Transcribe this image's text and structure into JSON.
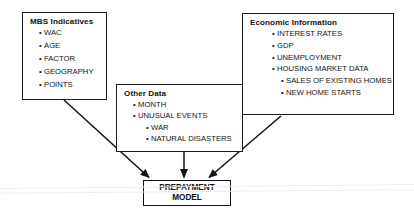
{
  "diagram": {
    "colors": {
      "border": "#1c1c1c",
      "text": "#141414",
      "background": "#ffffff",
      "arrow": "#111111"
    },
    "boxes": [
      {
        "id": "mbs-indicatives",
        "header": "MBS Indicatives",
        "items": [
          {
            "label": "WAC",
            "level": 1,
            "bullet": "•"
          },
          {
            "label": "AGE",
            "level": 1,
            "bullet": "•"
          },
          {
            "label": "FACTOR",
            "level": 1,
            "bullet": "•"
          },
          {
            "label": "GEOGRAPHY",
            "level": 1,
            "bullet": "•"
          },
          {
            "label": "POINTS",
            "level": 1,
            "bullet": "•"
          }
        ]
      },
      {
        "id": "other-data",
        "header": "Other Data",
        "items": [
          {
            "label": "MONTH",
            "level": 1,
            "bullet": "•"
          },
          {
            "label": "UNUSUAL EVENTS",
            "level": 1,
            "bullet": "•"
          },
          {
            "label": "WAR",
            "level": 2,
            "bullet": "•"
          },
          {
            "label": "NATURAL DISASTERS",
            "level": 2,
            "bullet": "•"
          }
        ]
      },
      {
        "id": "economic-information",
        "header": "Economic Information",
        "items": [
          {
            "label": "INTEREST RATES",
            "level": 1,
            "bullet": "•"
          },
          {
            "label": "GDP",
            "level": 1,
            "bullet": "•"
          },
          {
            "label": "UNEMPLOYMENT",
            "level": 1,
            "bullet": "•"
          },
          {
            "label": "HOUSING MARKET DATA",
            "level": 1,
            "bullet": "•"
          },
          {
            "label": "SALES OF EXISTING HOMES",
            "level": 2,
            "bullet": "•"
          },
          {
            "label": "NEW HOME STARTS",
            "level": 2,
            "bullet": "•"
          }
        ]
      }
    ],
    "target": {
      "id": "prepayment-model",
      "line1": "PREPAYMENT",
      "line2": "MODEL"
    },
    "arrows": [
      {
        "id": "mbs-to-model",
        "from": "mbs-indicatives",
        "to": "prepayment-model"
      },
      {
        "id": "other-to-model",
        "from": "other-data",
        "to": "prepayment-model"
      },
      {
        "id": "economic-to-model",
        "from": "economic-information",
        "to": "prepayment-model"
      }
    ]
  }
}
